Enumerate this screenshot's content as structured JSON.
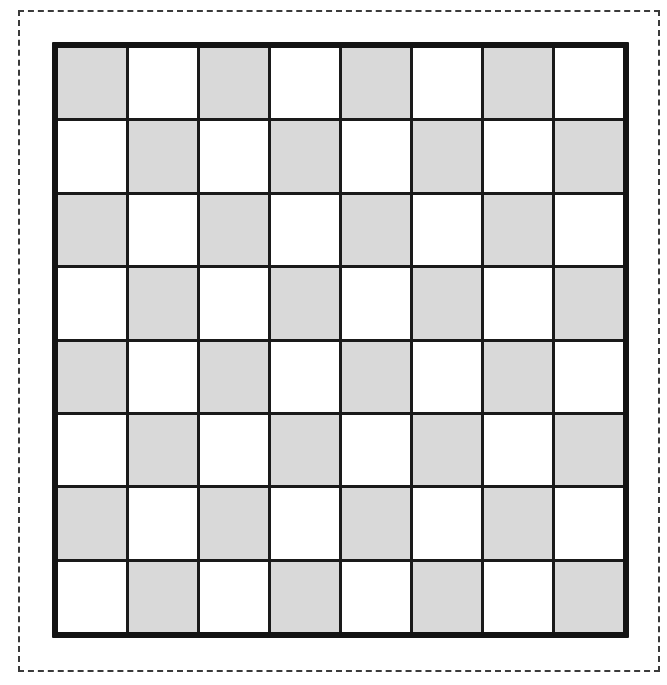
{
  "canvas": {
    "width": 667,
    "height": 685,
    "background_color": "#ffffff"
  },
  "dashed_frame": {
    "label": "selection-frame",
    "x": 18,
    "y": 10,
    "width": 642,
    "height": 662,
    "stroke_color": "#3a3a3a",
    "stroke_width": 2,
    "dash_length": 14,
    "dash_gap": 6,
    "style": "dashed"
  },
  "board": {
    "label": "checkerboard",
    "x": 52,
    "y": 42,
    "width": 577,
    "height": 596,
    "rows": 8,
    "columns": 8,
    "total_squares": 64,
    "border_color": "#141414",
    "border_width": 6,
    "grid_line_color": "#1a1a1a",
    "grid_line_width": 3,
    "light_square_color": "#ffffff",
    "dark_square_color": "#d9d9d9",
    "top_left_square": "dark",
    "pattern": "alternating",
    "cell_width": 70.6,
    "cell_height": 73.0,
    "squares": [
      [
        "dark",
        "light",
        "dark",
        "light",
        "dark",
        "light",
        "dark",
        "light"
      ],
      [
        "light",
        "dark",
        "light",
        "dark",
        "light",
        "dark",
        "light",
        "dark"
      ],
      [
        "dark",
        "light",
        "dark",
        "light",
        "dark",
        "light",
        "dark",
        "light"
      ],
      [
        "light",
        "dark",
        "light",
        "dark",
        "light",
        "dark",
        "light",
        "dark"
      ],
      [
        "dark",
        "light",
        "dark",
        "light",
        "dark",
        "light",
        "dark",
        "light"
      ],
      [
        "light",
        "dark",
        "light",
        "dark",
        "light",
        "dark",
        "light",
        "dark"
      ],
      [
        "dark",
        "light",
        "dark",
        "light",
        "dark",
        "light",
        "dark",
        "light"
      ],
      [
        "light",
        "dark",
        "light",
        "dark",
        "light",
        "dark",
        "light",
        "dark"
      ]
    ]
  }
}
